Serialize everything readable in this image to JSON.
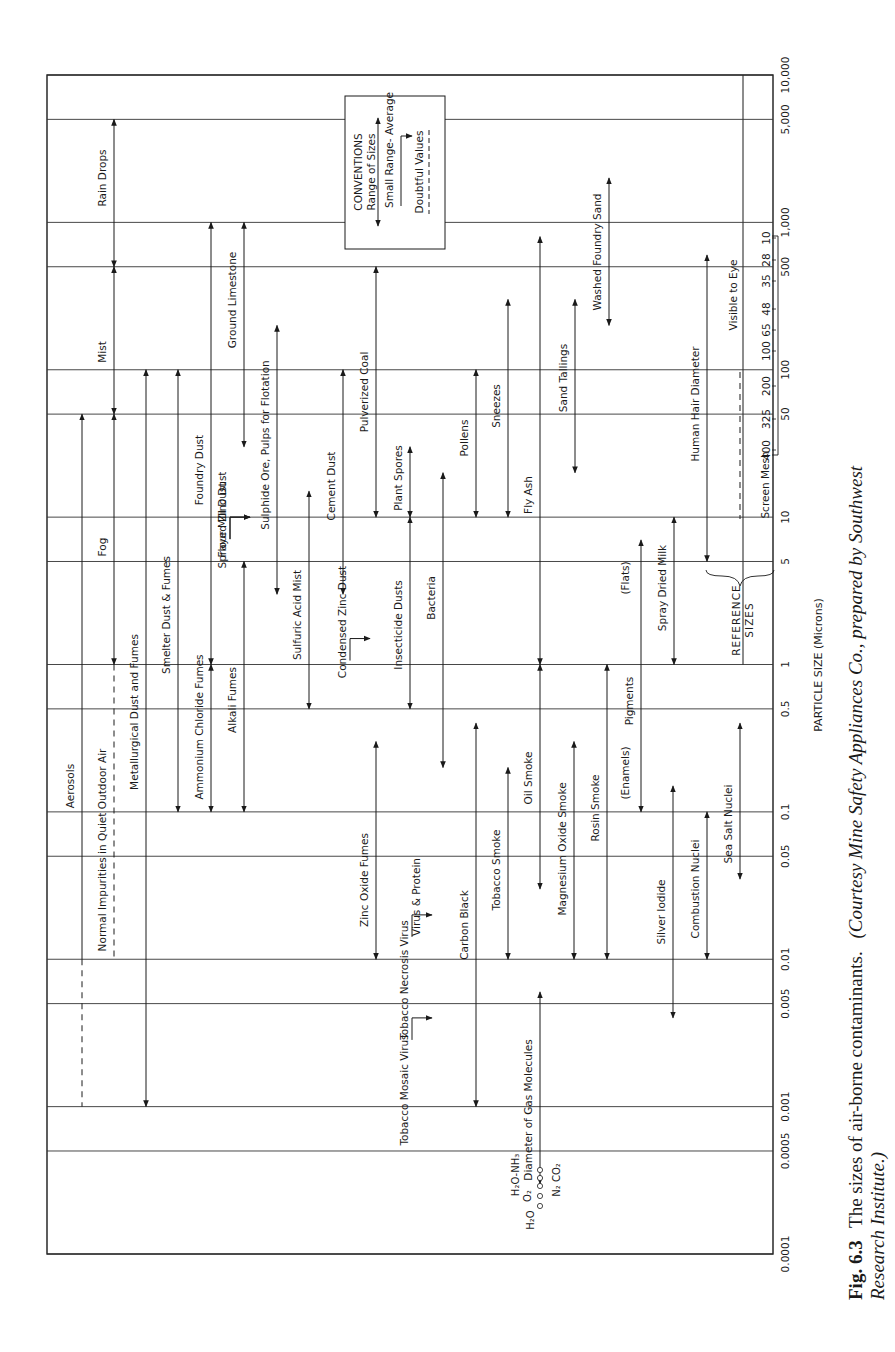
{
  "chart_data": {
    "type": "range-chart",
    "orientation": "rotated-90-ccw",
    "title": "",
    "xlabel": "PARTICLE SIZE (Microns)",
    "ylabel": "",
    "scale": "log",
    "xlim": [
      0.0001,
      10000
    ],
    "ticks": [
      {
        "label": "0.0001",
        "value": 0.0001,
        "y": 1254
      },
      {
        "label": "0.0005",
        "value": 0.0005,
        "y": 1151
      },
      {
        "label": "0.001",
        "value": 0.001,
        "y": 1106
      },
      {
        "label": "0.005",
        "value": 0.005,
        "y": 1004
      },
      {
        "label": "0.01",
        "value": 0.01,
        "y": 960
      },
      {
        "label": "0.05",
        "value": 0.05,
        "y": 858
      },
      {
        "label": "0.1",
        "value": 0.1,
        "y": 813
      },
      {
        "label": "0.5",
        "value": 0.5,
        "y": 711
      },
      {
        "label": "1",
        "value": 1,
        "y": 665
      },
      {
        "label": "5",
        "value": 5,
        "y": 563
      },
      {
        "label": "10",
        "value": 10,
        "y": 519
      },
      {
        "label": "50",
        "value": 50,
        "y": 417
      },
      {
        "label": "100",
        "value": 100,
        "y": 372
      },
      {
        "label": "500",
        "value": 500,
        "y": 268
      },
      {
        "label": "1,000",
        "value": 1000,
        "y": 224
      },
      {
        "label": "5,000",
        "value": 5000,
        "y": 121
      },
      {
        "label": "10,000",
        "value": 10000,
        "y": 75
      }
    ],
    "grid": true,
    "series": [
      {
        "name": "Rain Drops",
        "min": 500,
        "max": 5000,
        "x": 114,
        "style": "range",
        "label_y": 178
      },
      {
        "name": "Mist",
        "min": 50,
        "max": 500,
        "x": 114,
        "style": "range",
        "label_y": 352
      },
      {
        "name": "Fog",
        "min": 1,
        "max": 50,
        "x": 114,
        "style": "range",
        "label_y": 547
      },
      {
        "name": "Aerosols",
        "min": 0.001,
        "max": 50,
        "x": 82,
        "style": "range-doubtful-low",
        "doubtful_below": 0.01,
        "label_y": 786
      },
      {
        "name": "Normal Impurities in Quiet Outdoor Air",
        "min": 0.01,
        "max": 1,
        "x": 114,
        "style": "range-doubtful",
        "label_y": 850
      },
      {
        "name": "Metallurgical Dust and Fumes",
        "min": 0.001,
        "max": 100,
        "x": 146,
        "style": "range",
        "label_y": 712
      },
      {
        "name": "Smelter Dust & Fumes",
        "min": 0.1,
        "max": 100,
        "x": 178,
        "style": "range",
        "label_y": 615
      },
      {
        "name": "Ammonium Chloride Fumes",
        "min": 0.1,
        "max": 1,
        "x": 211,
        "style": "range",
        "label_y": 727
      },
      {
        "name": "Foundry Dust",
        "min": 1,
        "max": 1000,
        "x": 211,
        "style": "range",
        "label_y": 470
      },
      {
        "name": "Flour Mill Dust",
        "min": 10,
        "max": 10,
        "x": 238,
        "style": "average",
        "label_y": 520
      },
      {
        "name": "Sprayed Zinc Dust",
        "min": 10,
        "max": 10,
        "x": 238,
        "style": "average",
        "label_y": 520
      },
      {
        "name": "Alkali Fumes",
        "min": 0.1,
        "max": 5,
        "x": 244,
        "style": "range",
        "label_y": 700
      },
      {
        "name": "Ground Limestone",
        "min": 30,
        "max": 1000,
        "x": 244,
        "style": "range",
        "label_y": 300
      },
      {
        "name": "Sulphide Ore, Pulps for Flotation",
        "min": 3,
        "max": 200,
        "x": 277,
        "style": "range",
        "label_y": 445
      },
      {
        "name": "Sulfuric Acid Mist",
        "min": 0.5,
        "max": 15,
        "x": 309,
        "style": "range",
        "label_y": 615
      },
      {
        "name": "Cement Dust",
        "min": 3,
        "max": 100,
        "x": 343,
        "style": "range",
        "label_y": 486
      },
      {
        "name": "Condensed Zinc Dust",
        "min": 1.5,
        "max": 1.5,
        "x": 358,
        "style": "average",
        "label_y": 622
      },
      {
        "name": "Pulverized Coal",
        "min": 10,
        "max": 500,
        "x": 376,
        "style": "range",
        "label_y": 392
      },
      {
        "name": "Zinc Oxide Fumes",
        "min": 0.01,
        "max": 0.3,
        "x": 376,
        "style": "range",
        "label_y": 880
      },
      {
        "name": "Plant Spores",
        "min": 10,
        "max": 30,
        "x": 410,
        "style": "range",
        "label_y": 478
      },
      {
        "name": "Insecticide Dusts",
        "min": 0.5,
        "max": 10,
        "x": 410,
        "style": "range",
        "label_y": 625
      },
      {
        "name": "Tobacco Necrosis Virus",
        "min": 0.02,
        "max": 0.02,
        "x": 420,
        "style": "average",
        "label_y": 980
      },
      {
        "name": "Virus & Protein",
        "min": 0.005,
        "max": 0.05,
        "x": 432,
        "style": "label",
        "label_y": 897
      },
      {
        "name": "Tobacco Mosaic Virus",
        "min": 0.004,
        "max": 0.004,
        "x": 420,
        "style": "average",
        "label_y": 1090
      },
      {
        "name": "Bacteria",
        "min": 0.2,
        "max": 20,
        "x": 443,
        "style": "range",
        "label_y": 598
      },
      {
        "name": "Carbon Black",
        "min": 0.001,
        "max": 0.4,
        "x": 476,
        "style": "range",
        "label_y": 925
      },
      {
        "name": "Pollens",
        "min": 10,
        "max": 100,
        "x": 476,
        "style": "range",
        "label_y": 438
      },
      {
        "name": "Tobacco Smoke",
        "min": 0.01,
        "max": 0.2,
        "x": 508,
        "style": "range",
        "label_y": 870
      },
      {
        "name": "Sneezes",
        "min": 10,
        "max": 300,
        "x": 508,
        "style": "range",
        "label_y": 406
      },
      {
        "name": "Diameter of Gas Molecules",
        "min": 0.0003,
        "max": 0.006,
        "x": 540,
        "style": "range",
        "label_y": 1110
      },
      {
        "name": "Oil Smoke",
        "min": 0.03,
        "max": 1,
        "x": 540,
        "style": "range",
        "label_y": 778
      },
      {
        "name": "Fly Ash",
        "min": 1,
        "max": 800,
        "x": 540,
        "style": "range",
        "label_y": 495
      },
      {
        "name": "Magnesium Oxide Smoke",
        "min": 0.01,
        "max": 0.3,
        "x": 574,
        "style": "range",
        "label_y": 849
      },
      {
        "name": "Sand Tallings",
        "min": 20,
        "max": 300,
        "x": 575,
        "style": "range",
        "label_y": 378
      },
      {
        "name": "Rosin Smoke",
        "min": 0.01,
        "max": 1,
        "x": 607,
        "style": "range",
        "label_y": 808
      },
      {
        "name": "Washed Foundry Sand",
        "min": 200,
        "max": 2000,
        "x": 609,
        "style": "range",
        "label_y": 252
      },
      {
        "name": "Pigments",
        "min": 0.1,
        "max": 7,
        "x": 641,
        "style": "range",
        "label_y": 701
      },
      {
        "name": "(Flats)",
        "min": 0.1,
        "max": 7,
        "x": 641,
        "style": "label",
        "label_y": 578
      },
      {
        "name": "(Enamels)",
        "min": 0.1,
        "max": 7,
        "x": 641,
        "style": "label",
        "label_y": 773
      },
      {
        "name": "Silver Iodide",
        "min": 0.004,
        "max": 0.15,
        "x": 673,
        "style": "range",
        "label_y": 912
      },
      {
        "name": "Spray Dried Milk",
        "min": 1,
        "max": 10,
        "x": 674,
        "style": "range",
        "label_y": 588
      },
      {
        "name": "Combustion Nuclei",
        "min": 0.01,
        "max": 0.1,
        "x": 707,
        "style": "range",
        "label_y": 889
      },
      {
        "name": "Human Hair Diameter",
        "min": 5,
        "max": 600,
        "x": 707,
        "style": "range",
        "label_y": 404
      },
      {
        "name": "Sea Salt Nuclei",
        "min": 0.035,
        "max": 0.4,
        "x": 740,
        "style": "range",
        "label_y": 824
      }
    ],
    "reference_sizes": {
      "label": "REFERENCE SIZES",
      "visible_to_eye": {
        "label": "Visible to Eye",
        "min": 40,
        "doubtful_below": 10
      },
      "screen_mesh": {
        "label": "Screen Mesh",
        "values": [
          "400",
          "325",
          "200",
          "100",
          "65",
          "48",
          "35",
          "28",
          "10"
        ]
      }
    },
    "conventions": {
      "title": "CONVENTIONS",
      "items": [
        "Range of Sizes",
        "Small Range- Average",
        "Doubtful Values"
      ]
    },
    "gas_molecules": {
      "labels": [
        "H₂O-NH₃",
        "O₂",
        "H₂O",
        "N₂ CO₂"
      ]
    }
  },
  "caption": {
    "figure_label": "Fig. 6.3",
    "text": "The sizes of air-borne contaminants.",
    "credit_line1": "(Courtesy Mine Safety Appliances Co., prepared by Southwest",
    "credit_line2": "Research Institute.)"
  }
}
